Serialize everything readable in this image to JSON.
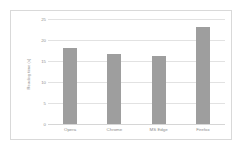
{
  "chart_data": {
    "type": "bar",
    "title": "",
    "subtitle": "",
    "xlabel": "",
    "ylabel": "Reading time (s)",
    "categories": [
      "Opera",
      "Chrome",
      "MS Edge",
      "Firefox"
    ],
    "values": [
      18.1,
      16.6,
      16.3,
      23.2
    ],
    "series": [
      {
        "name": "Reading time",
        "values": [
          18.1,
          16.6,
          16.3,
          23.2
        ]
      }
    ],
    "ylim": [
      0,
      25
    ],
    "yticks": [
      0,
      5,
      10,
      15,
      20,
      25
    ],
    "ytick_labels": [
      "0",
      "5",
      "10",
      "15",
      "20",
      "25"
    ],
    "grid": "horizontal",
    "legend": "none",
    "bar_color": "#9e9e9e",
    "gridline_color": "#e2e2e2",
    "axis_text_color": "#8f8f8f",
    "plot_background": "#ffffff",
    "border_color": "#d9d9d9",
    "annotations": []
  }
}
